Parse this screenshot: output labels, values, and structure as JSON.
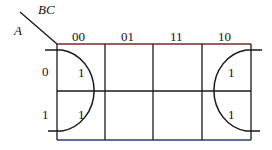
{
  "kmap": {
    "row_var": "A",
    "col_var": "BC",
    "col_headers": [
      "00",
      "01",
      "11",
      "10"
    ],
    "row_headers": [
      "0",
      "1"
    ],
    "cells": [
      [
        "1",
        "",
        "",
        "1"
      ],
      [
        "1",
        "",
        "",
        "1"
      ]
    ],
    "groups": [
      {
        "name": "left-group",
        "cells": [
          [
            0,
            0
          ],
          [
            1,
            0
          ]
        ]
      },
      {
        "name": "right-group",
        "cells": [
          [
            0,
            3
          ],
          [
            1,
            3
          ]
        ]
      }
    ]
  },
  "colors": {
    "line": "#1a1a1a",
    "top_line": "#8a2a2a",
    "bottom_line": "#2a3a7a"
  }
}
